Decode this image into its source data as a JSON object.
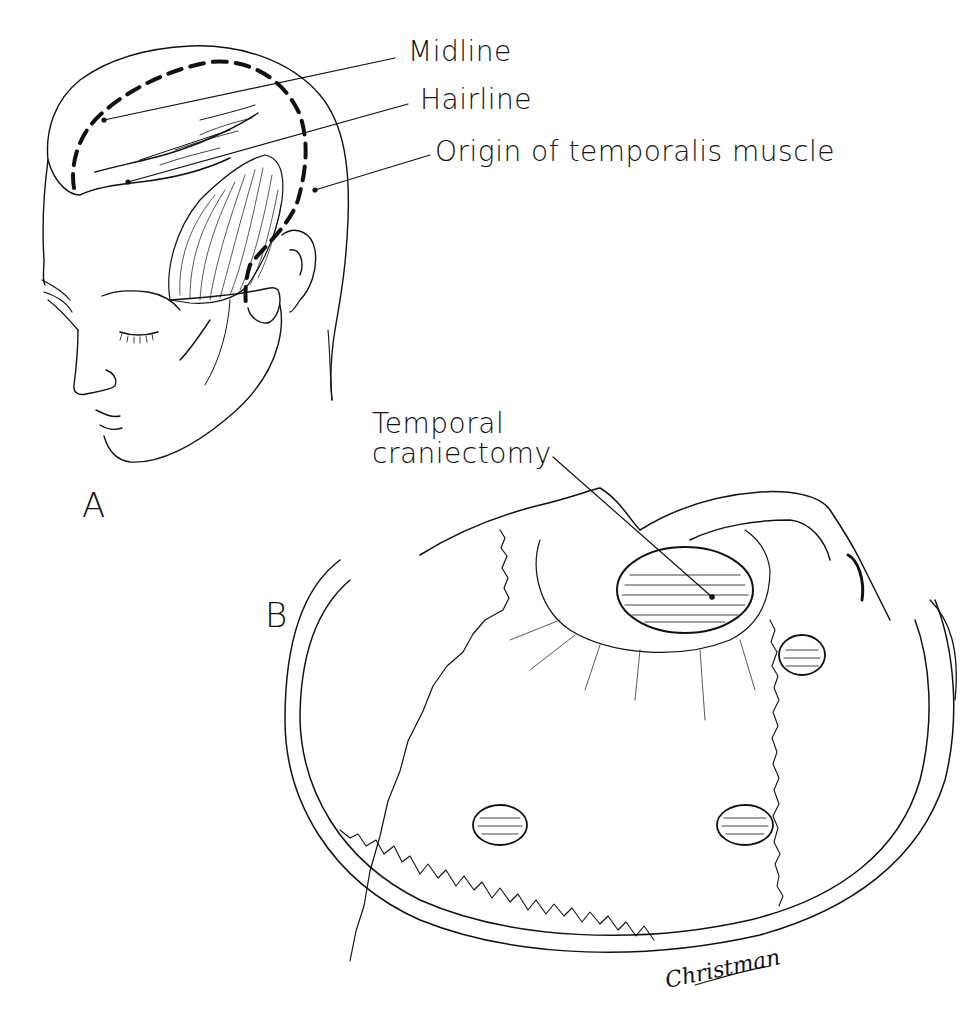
{
  "figure": {
    "panel_a": {
      "letter": "A",
      "labels": {
        "midline": "Midline",
        "hairline": "Hairline",
        "temporalis": "Origin of temporalis muscle"
      }
    },
    "panel_b": {
      "letter": "B",
      "labels": {
        "craniectomy_line1": "Temporal",
        "craniectomy_line2": "craniectomy"
      }
    },
    "signature": "Christman",
    "colors": {
      "ink": "#111111",
      "background": "#ffffff"
    }
  }
}
